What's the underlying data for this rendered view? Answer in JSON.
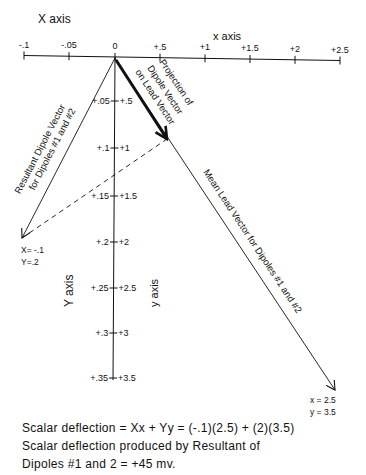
{
  "diagram": {
    "x_axis_title_upper": "X axis",
    "x_axis_title_lower": "x axis",
    "y_axis_title_upper": "Y axis",
    "y_axis_title_lower": "y axis",
    "x_ticks": [
      {
        "label": "-.1",
        "x": 24
      },
      {
        "label": "-.05",
        "x": 69
      },
      {
        "label": "0",
        "x": 115
      },
      {
        "label": "+.5",
        "x": 160
      },
      {
        "label": "+1",
        "x": 205
      },
      {
        "label": "+1.5",
        "x": 250
      },
      {
        "label": "+2",
        "x": 295
      },
      {
        "label": "+2.5",
        "x": 340
      }
    ],
    "y_ticks": [
      {
        "left": "+.05",
        "right": "+.5",
        "y": 101
      },
      {
        "left": "+.1",
        "right": "+1",
        "y": 148
      },
      {
        "left": "+.15",
        "right": "+1.5",
        "y": 196
      },
      {
        "left": "+.2",
        "right": "+2",
        "y": 242
      },
      {
        "left": "+.25",
        "right": "+2.5",
        "y": 288
      },
      {
        "left": "+.3",
        "right": "+3",
        "y": 333
      },
      {
        "left": "+.35",
        "right": "+3.5",
        "y": 378
      }
    ],
    "resultant_label_line1": "Resultant Dipole Vector",
    "resultant_label_line2": "for Dipoles #1 and #2",
    "projection_label_line1": "Projection of",
    "projection_label_line2": "Dipole Vector",
    "projection_label_line3": "on Lead Vector",
    "mean_lead_label": "Mean Lead Vector for Dipoles #1 and #2",
    "resultant_endpoint_x": "X= -.1",
    "resultant_endpoint_y": "Y=.2",
    "lead_endpoint_x": "x = 2.5",
    "lead_endpoint_y": "y = 3.5"
  },
  "caption": {
    "line1": "Scalar  deflection = Xx + Yy = (-.1)(2.5) + (2)(3.5)",
    "line2": "Scalar  deflection  produced  by  Resultant  of",
    "line3": "Dipoles #1  and  2 = +45  mv."
  }
}
